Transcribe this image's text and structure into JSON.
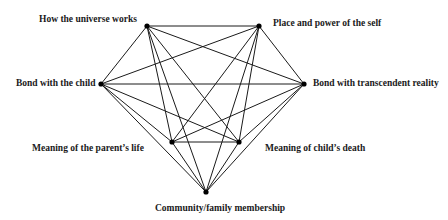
{
  "diagram": {
    "type": "complete-graph",
    "line_color": "#1a1a1a",
    "node_color": "#000000",
    "nodes": [
      {
        "id": "universe",
        "label": "How the universe works",
        "x": 147,
        "y": 26,
        "label_x": 39,
        "label_y": 14
      },
      {
        "id": "self",
        "label": "Place and power of the self",
        "x": 259,
        "y": 26,
        "label_x": 273,
        "label_y": 18
      },
      {
        "id": "child",
        "label": "Bond with the child",
        "x": 101,
        "y": 84,
        "label_x": 16,
        "label_y": 78
      },
      {
        "id": "transcendent",
        "label": "Bond with transcendent reality",
        "x": 304,
        "y": 84,
        "label_x": 313,
        "label_y": 78
      },
      {
        "id": "parent_life",
        "label": "Meaning of the parent’s life",
        "x": 172,
        "y": 142,
        "label_x": 32,
        "label_y": 143
      },
      {
        "id": "child_death",
        "label": "Meaning of child’s death",
        "x": 239,
        "y": 142,
        "label_x": 265,
        "label_y": 143
      },
      {
        "id": "community",
        "label": "Community/family membership",
        "x": 206,
        "y": 192,
        "label_x": 155,
        "label_y": 203
      }
    ]
  }
}
